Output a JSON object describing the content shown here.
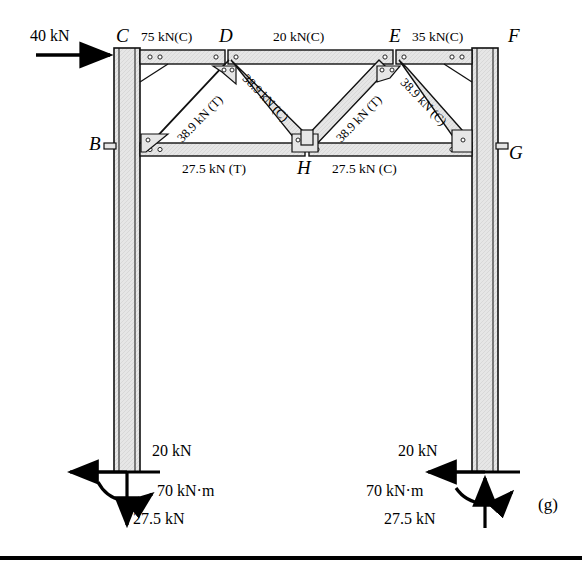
{
  "figure": {
    "caption": "(g)",
    "applied_load": "40 kN"
  },
  "nodes": [
    {
      "id": "B",
      "label": "B"
    },
    {
      "id": "C",
      "label": "C"
    },
    {
      "id": "D",
      "label": "D"
    },
    {
      "id": "E",
      "label": "E"
    },
    {
      "id": "F",
      "label": "F"
    },
    {
      "id": "G",
      "label": "G"
    },
    {
      "id": "H",
      "label": "H"
    }
  ],
  "top_chord_forces": [
    {
      "span": "C-D",
      "label": "75 kN(C)"
    },
    {
      "span": "D-E",
      "label": "20 kN(C)"
    },
    {
      "span": "E-F",
      "label": "35 kN(C)"
    }
  ],
  "bottom_chord_forces": [
    {
      "span": "B-H",
      "label": "27.5 kN (T)"
    },
    {
      "span": "H-G",
      "label": "27.5 kN (C)"
    }
  ],
  "diagonal_forces": [
    {
      "span": "B-D",
      "label": "38.9 kN (T)"
    },
    {
      "span": "D-H",
      "label": "38.9 kN (C)"
    },
    {
      "span": "H-E",
      "label": "38.9 kN (T)"
    },
    {
      "span": "E-G",
      "label": "38.9 kN (C)"
    }
  ],
  "supports": {
    "left": {
      "horizontal": "20 kN",
      "moment": "70 kN·m",
      "vertical": "27.5 kN"
    },
    "right": {
      "horizontal": "20 kN",
      "moment": "70 kN·m",
      "vertical": "27.5 kN"
    }
  },
  "colors": {
    "steel_fill": "#e4e4e4",
    "outline": "#111111",
    "background": "#ffffff"
  }
}
